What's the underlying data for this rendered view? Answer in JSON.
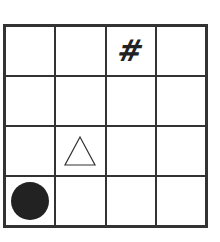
{
  "board": {
    "rows": 4,
    "cols": 4,
    "cells": [
      [
        "",
        "",
        "hash",
        ""
      ],
      [
        "",
        "",
        "",
        ""
      ],
      [
        "",
        "triangle",
        "",
        ""
      ],
      [
        "circle",
        "",
        "",
        ""
      ]
    ]
  },
  "pieces": {
    "hash": {
      "glyph": "#",
      "row": 0,
      "col": 2,
      "color": "#222222"
    },
    "triangle": {
      "row": 2,
      "col": 1,
      "style": "outline"
    },
    "circle": {
      "row": 3,
      "col": 0,
      "color": "#222222"
    }
  },
  "colors": {
    "grid": "#333333",
    "background": "#ffffff"
  }
}
